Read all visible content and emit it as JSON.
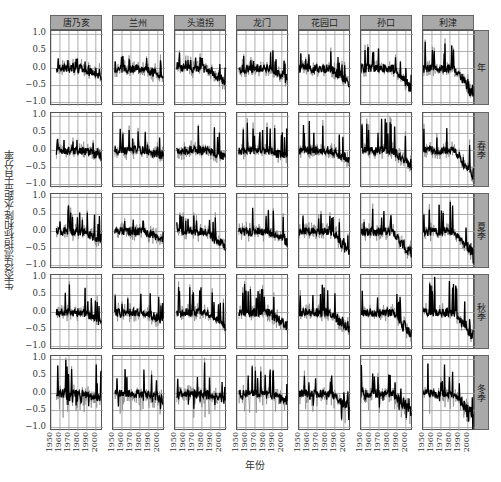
{
  "chart_data": {
    "type": "line",
    "title": "",
    "xlabel": "年份",
    "ylabel": "生态径流指标和降水距平百分率",
    "ylim": [
      -1.1,
      1.1
    ],
    "xlim": [
      1950,
      2008
    ],
    "yticks": [
      "1.0",
      "0.5",
      "0.0",
      "−0.5",
      "−1.0"
    ],
    "xticks": [
      "1950",
      "1960",
      "1970",
      "1980",
      "1990",
      "2000"
    ],
    "grid": true,
    "facet_columns": [
      "唐乃亥",
      "兰州",
      "头道拐",
      "龙门",
      "花园口",
      "孙口",
      "利津"
    ],
    "facet_rows": [
      "年",
      "春季",
      "夏季",
      "秋季",
      "冬季"
    ],
    "series": [
      {
        "name": "生态径流指标",
        "style": "black thick line"
      },
      {
        "name": "降水距平百分率",
        "style": "gray thin line"
      }
    ],
    "panels_summary": [
      {
        "row": "年",
        "trend": [
          "flat ~0 with peaks to 0.35",
          "start 0.4 then decline to -0.3",
          "peaks 0.45 then decline to -0.45",
          "peak 0.5 then decline to -0.35",
          "peak 0.55 then decline to -0.55",
          "peak 0.7 then decline to -0.7",
          "peak 0.85 then decline to -0.9"
        ]
      },
      {
        "row": "春季",
        "trend": [
          "flat ~0 peaks 0.4",
          "spike 0.6 then flat",
          "spikes to 0.8",
          "spike 0.8 then flat/decline",
          "spikes 0.8 decline -0.3",
          "spikes 0.9 decline -0.5",
          "spikes 0.9 decline -0.9"
        ]
      },
      {
        "row": "夏季",
        "trend": [
          "peaks to 0.7",
          "peaks 0.4 decline -0.3",
          "peaks 0.6 decline -0.55",
          "spike 0.8 decline -0.35",
          "peaks 0.6 decline -0.7",
          "peaks 0.6 decline -0.85",
          "peaks 0.8 decline -0.9"
        ]
      },
      {
        "row": "秋季",
        "trend": [
          "peaks 0.8",
          "peaks 0.7",
          "peaks 0.8 decline -0.5",
          "peaks 0.8 decline -0.5",
          "peaks 0.8 decline -0.6",
          "peaks 0.8 decline -0.8",
          "peaks 1.0 decline -0.9"
        ]
      },
      {
        "row": "冬季",
        "trend": [
          "peaks to 1.0 late",
          "peaks 0.8 late",
          "peaks 0.9 late",
          "spikes 0.7",
          "spikes 0.7, dip -0.8",
          "spikes 0.8, dip -0.8",
          "spikes 0.8, dip -0.8"
        ]
      }
    ]
  }
}
